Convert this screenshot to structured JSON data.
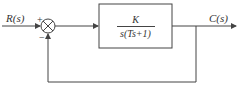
{
  "diagram": {
    "type": "feedback-control-block-diagram",
    "input_label": "R(s)",
    "output_label": "C(s)",
    "summing_junction": {
      "plus_sign": "+",
      "minus_sign": "−"
    },
    "forward_block": {
      "numerator": "K",
      "denominator": "s(Ts+1)"
    },
    "feedback": "unity negative feedback",
    "colors": {
      "line": "#444444",
      "text": "#333333",
      "background": "#ffffff"
    }
  }
}
